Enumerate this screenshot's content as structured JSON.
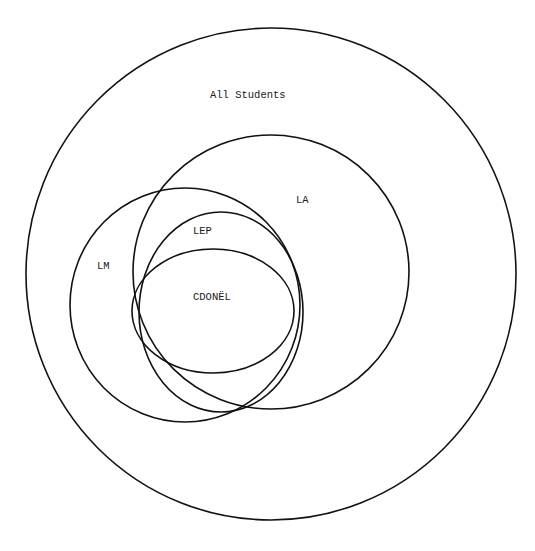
{
  "diagram": {
    "type": "venn-nested-sets",
    "sets": [
      {
        "id": "all",
        "label": "All Students",
        "shape": {
          "cx": 271,
          "cy": 274,
          "rx": 245,
          "ry": 246
        },
        "label_pos": {
          "x": 210,
          "y": 98
        }
      },
      {
        "id": "la",
        "label": "LA",
        "shape": {
          "cx": 271,
          "cy": 272,
          "rx": 138,
          "ry": 137
        },
        "label_pos": {
          "x": 296,
          "y": 203
        }
      },
      {
        "id": "lm",
        "label": "LM",
        "shape": {
          "cx": 185,
          "cy": 305,
          "rx": 115,
          "ry": 117
        },
        "label_pos": {
          "x": 97,
          "y": 269
        }
      },
      {
        "id": "lep",
        "label": "LEP",
        "shape": {
          "cx": 221,
          "cy": 312,
          "rx": 82,
          "ry": 100
        },
        "label_pos": {
          "x": 193,
          "y": 234
        }
      },
      {
        "id": "cdonel",
        "label": "CDONËL",
        "shape": {
          "cx": 213,
          "cy": 311,
          "rx": 81,
          "ry": 62
        },
        "label_pos": {
          "x": 193,
          "y": 300
        }
      }
    ],
    "stroke_color": "#111111",
    "background": "#ffffff"
  }
}
